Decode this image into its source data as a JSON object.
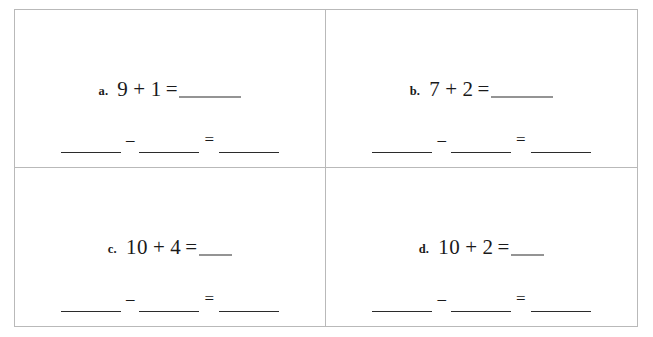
{
  "worksheet": {
    "title": "Addition and subtraction fact family worksheet",
    "grid": {
      "columns": 2,
      "rows": 2
    },
    "border_color": "#b9b9b9",
    "ink_color": "#2b2b2b",
    "background": "#ffffff",
    "problems": [
      {
        "label": "a.",
        "addend1": "9",
        "plus": "+",
        "addend2": "1",
        "equals": "=",
        "answer_blank": "",
        "answer_blank_size": "long",
        "subtraction": {
          "minuend_blank": "",
          "minus": "–",
          "subtrahend_blank": "",
          "equals": "=",
          "difference_blank": ""
        }
      },
      {
        "label": "b.",
        "addend1": "7",
        "plus": "+",
        "addend2": "2",
        "equals": "=",
        "answer_blank": "",
        "answer_blank_size": "long",
        "subtraction": {
          "minuend_blank": "",
          "minus": "–",
          "subtrahend_blank": "",
          "equals": "=",
          "difference_blank": ""
        }
      },
      {
        "label": "c.",
        "addend1": "10",
        "plus": "+",
        "addend2": "4",
        "equals": "=",
        "answer_blank": "",
        "answer_blank_size": "short",
        "subtraction": {
          "minuend_blank": "",
          "minus": "–",
          "subtrahend_blank": "",
          "equals": "=",
          "difference_blank": ""
        }
      },
      {
        "label": "d.",
        "addend1": "10",
        "plus": "+",
        "addend2": "2",
        "equals": "=",
        "answer_blank": "",
        "answer_blank_size": "short",
        "subtraction": {
          "minuend_blank": "",
          "minus": "–",
          "subtrahend_blank": "",
          "equals": "=",
          "difference_blank": ""
        }
      }
    ]
  }
}
